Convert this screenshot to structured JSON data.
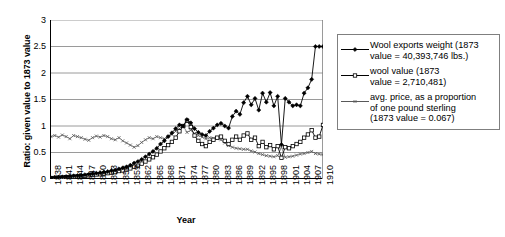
{
  "chart_data": {
    "type": "line",
    "title": "",
    "xlabel": "Year",
    "ylabel": "Ratio: given value to 1873 value",
    "ylim": [
      0,
      3
    ],
    "ytick_values": [
      0,
      0.5,
      1,
      1.5,
      2,
      2.5,
      3
    ],
    "ytick_labels": [
      "0",
      "0.5",
      "1",
      "1.5",
      "2",
      "2.5",
      "3"
    ],
    "grid": "horizontal",
    "legend_position": "right-outside",
    "xlim": [
      1838,
      1910
    ],
    "x": [
      1838,
      1839,
      1840,
      1841,
      1842,
      1843,
      1844,
      1845,
      1846,
      1847,
      1848,
      1849,
      1850,
      1851,
      1852,
      1853,
      1854,
      1855,
      1856,
      1857,
      1858,
      1859,
      1860,
      1861,
      1862,
      1863,
      1864,
      1865,
      1866,
      1867,
      1868,
      1869,
      1870,
      1871,
      1872,
      1873,
      1874,
      1875,
      1876,
      1877,
      1878,
      1879,
      1880,
      1881,
      1882,
      1883,
      1884,
      1885,
      1886,
      1887,
      1888,
      1889,
      1890,
      1891,
      1892,
      1893,
      1894,
      1895,
      1896,
      1897,
      1898,
      1899,
      1900,
      1901,
      1902,
      1903,
      1904,
      1905,
      1906,
      1907,
      1908,
      1909,
      1910
    ],
    "xtick_labels": [
      "1838",
      "1841",
      "1844",
      "1847",
      "1850",
      "1853",
      "1856",
      "1859",
      "1862",
      "1865",
      "1868",
      "1871",
      "1874",
      "1877",
      "1880",
      "1883",
      "1886",
      "1889",
      "1892",
      "1895",
      "1898",
      "1901",
      "1904",
      "1907",
      "1910"
    ],
    "xtick_step": 3,
    "series": [
      {
        "name": "Wool exports weight (1873 value = 40,393,746 lbs.)",
        "marker": "filled-diamond",
        "color": "#000000",
        "values": [
          0.02,
          0.03,
          0.035,
          0.04,
          0.045,
          0.05,
          0.06,
          0.065,
          0.07,
          0.08,
          0.09,
          0.1,
          0.11,
          0.12,
          0.13,
          0.14,
          0.16,
          0.17,
          0.19,
          0.21,
          0.23,
          0.26,
          0.3,
          0.33,
          0.37,
          0.42,
          0.47,
          0.52,
          0.58,
          0.66,
          0.72,
          0.8,
          0.87,
          0.95,
          1.02,
          1.0,
          1.12,
          1.06,
          0.95,
          0.88,
          0.84,
          0.82,
          0.9,
          0.96,
          1.02,
          1.05,
          1.0,
          0.96,
          1.18,
          1.28,
          1.22,
          1.44,
          1.56,
          1.4,
          1.52,
          1.3,
          1.62,
          1.45,
          1.63,
          1.38,
          1.56,
          0.65,
          1.52,
          1.45,
          1.38,
          1.4,
          1.38,
          1.62,
          1.72,
          1.88,
          2.5,
          2.5,
          2.5
        ]
      },
      {
        "name": "wool value (1873 value = 2,710,481)",
        "marker": "open-square",
        "color": "#000000",
        "values": [
          0.015,
          0.02,
          0.025,
          0.03,
          0.035,
          0.04,
          0.045,
          0.05,
          0.055,
          0.06,
          0.07,
          0.075,
          0.085,
          0.09,
          0.1,
          0.11,
          0.12,
          0.13,
          0.15,
          0.16,
          0.18,
          0.2,
          0.23,
          0.25,
          0.29,
          0.33,
          0.37,
          0.41,
          0.46,
          0.52,
          0.58,
          0.64,
          0.7,
          0.78,
          0.9,
          1.0,
          1.1,
          0.98,
          0.82,
          0.72,
          0.66,
          0.62,
          0.7,
          0.74,
          0.78,
          0.8,
          0.72,
          0.66,
          0.74,
          0.8,
          0.74,
          0.82,
          0.86,
          0.74,
          0.78,
          0.62,
          0.7,
          0.6,
          0.64,
          0.56,
          0.62,
          0.4,
          0.6,
          0.58,
          0.62,
          0.66,
          0.7,
          0.78,
          0.84,
          0.92,
          0.78,
          0.8,
          1.02
        ]
      },
      {
        "name": "avg. price, as a proportion of one pound sterling (1873 value = 0.067)",
        "marker": "small-x",
        "color": "#595959",
        "values": [
          0.8,
          0.82,
          0.79,
          0.83,
          0.8,
          0.76,
          0.82,
          0.8,
          0.78,
          0.75,
          0.73,
          0.78,
          0.81,
          0.79,
          0.82,
          0.8,
          0.76,
          0.74,
          0.78,
          0.72,
          0.68,
          0.64,
          0.6,
          0.63,
          0.69,
          0.74,
          0.78,
          0.76,
          0.8,
          0.78,
          0.76,
          0.8,
          0.84,
          0.9,
          0.95,
          1.0,
          0.88,
          0.92,
          0.86,
          0.82,
          0.79,
          0.76,
          0.78,
          0.77,
          0.76,
          0.74,
          0.68,
          0.63,
          0.6,
          0.58,
          0.57,
          0.56,
          0.56,
          0.53,
          0.51,
          0.48,
          0.46,
          0.44,
          0.43,
          0.42,
          0.44,
          0.6,
          0.41,
          0.42,
          0.43,
          0.45,
          0.47,
          0.48,
          0.5,
          0.52,
          0.48,
          0.47,
          0.46
        ]
      }
    ]
  },
  "axes": {
    "y_title": "Ratio: given value to 1873 value",
    "x_title": "Year"
  },
  "legend": {
    "items": [
      {
        "marker": "filled-diamond",
        "label": "Wool exports weight (1873\nvalue = 40,393,746 lbs.)"
      },
      {
        "marker": "open-square",
        "label": "wool value (1873\nvalue = 2,710,481)"
      },
      {
        "marker": "small-x",
        "label": "avg. price, as a proportion\nof one pound sterling\n(1873 value = 0.067)"
      }
    ]
  },
  "colors": {
    "axis": "#000000",
    "gridline": "#808080",
    "legend_border": "#7f7f7f",
    "series_price": "#595959"
  }
}
